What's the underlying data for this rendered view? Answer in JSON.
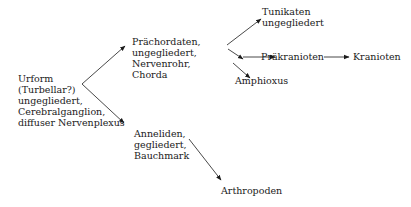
{
  "diagram": {
    "type": "phylogenetic-flow",
    "language": "de",
    "nodes": [
      {
        "id": "urform",
        "lines": [
          "Urform",
          "(Turbellar?)",
          "ungegliedert,",
          "Cerebralganglion,",
          "diffuser Nervenplexus"
        ]
      },
      {
        "id": "praechordaten",
        "lines": [
          "Prächordaten,",
          "ungegliedert,",
          "Nervenrohr,",
          "Chorda"
        ]
      },
      {
        "id": "tunikaten",
        "lines": [
          "Tunikaten",
          "ungegliedert"
        ]
      },
      {
        "id": "praekranioten",
        "lines": [
          "Präkranioten"
        ]
      },
      {
        "id": "kranioten",
        "lines": [
          "Kranioten"
        ]
      },
      {
        "id": "amphioxus",
        "lines": [
          "Amphioxus"
        ]
      },
      {
        "id": "anneliden",
        "lines": [
          "Anneliden,",
          "gegliedert,",
          "Bauchmark"
        ]
      },
      {
        "id": "arthropoden",
        "lines": [
          "Arthropoden"
        ]
      }
    ],
    "edges": [
      {
        "from": "urform",
        "to": "praechordaten"
      },
      {
        "from": "urform",
        "to": "anneliden"
      },
      {
        "from": "praechordaten",
        "to": "tunikaten"
      },
      {
        "from": "praechordaten",
        "to": "praekranioten"
      },
      {
        "from": "praechordaten",
        "to": "amphioxus"
      },
      {
        "from": "praekranioten",
        "to": "kranioten"
      },
      {
        "from": "anneliden",
        "to": "arthropoden"
      }
    ],
    "colors": {
      "ink": "#1a1a1a",
      "background": "#ffffff"
    }
  }
}
